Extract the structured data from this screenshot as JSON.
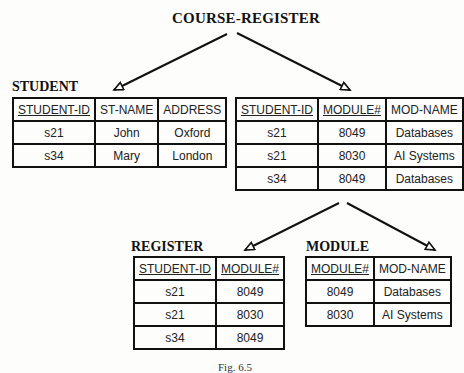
{
  "diagram": {
    "root_title": "COURSE-REGISTER",
    "caption": "Fig. 6.5",
    "tables": {
      "course_register": {
        "name": "",
        "columns": [
          {
            "label": "STUDENT-ID",
            "key": true
          },
          {
            "label": "MODULE#",
            "key": true
          },
          {
            "label": "MOD-NAME",
            "key": false
          }
        ],
        "rows": [
          [
            "s21",
            "8049",
            "Databases"
          ],
          [
            "s21",
            "8030",
            "AI Systems"
          ],
          [
            "s34",
            "8049",
            "Databases"
          ]
        ]
      },
      "student": {
        "name": "STUDENT",
        "columns": [
          {
            "label": "STUDENT-ID",
            "key": true
          },
          {
            "label": "ST-NAME",
            "key": false
          },
          {
            "label": "ADDRESS",
            "key": false
          }
        ],
        "rows": [
          [
            "s21",
            "John",
            "Oxford"
          ],
          [
            "s34",
            "Mary",
            "London"
          ]
        ]
      },
      "register": {
        "name": "REGISTER",
        "columns": [
          {
            "label": "STUDENT-ID",
            "key": true
          },
          {
            "label": "MODULE#",
            "key": true
          }
        ],
        "rows": [
          [
            "s21",
            "8049"
          ],
          [
            "s21",
            "8030"
          ],
          [
            "s34",
            "8049"
          ]
        ]
      },
      "module": {
        "name": "MODULE",
        "columns": [
          {
            "label": "MODULE#",
            "key": true
          },
          {
            "label": "MOD-NAME",
            "key": false
          }
        ],
        "rows": [
          [
            "8049",
            "Databases"
          ],
          [
            "8030",
            "AI Systems"
          ]
        ]
      }
    },
    "edges": [
      {
        "from": "COURSE-REGISTER",
        "to": "STUDENT"
      },
      {
        "from": "COURSE-REGISTER",
        "to": "course_register"
      },
      {
        "from": "course_register",
        "to": "REGISTER"
      },
      {
        "from": "course_register",
        "to": "MODULE"
      }
    ]
  }
}
